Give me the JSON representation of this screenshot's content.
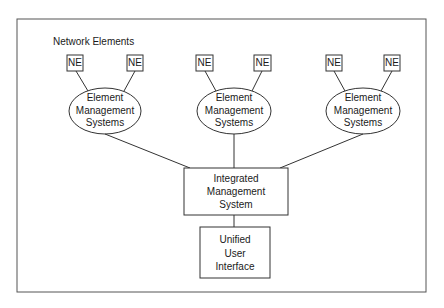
{
  "diagram": {
    "section_label": "Network Elements",
    "ne_label": "NE",
    "ems_groups": [
      {
        "line1": "Element",
        "line2": "Management",
        "line3": "Systems",
        "ne_left": "NE",
        "ne_right": "NE"
      },
      {
        "line1": "Element",
        "line2": "Management",
        "line3": "Systems",
        "ne_left": "NE",
        "ne_right": "NE"
      },
      {
        "line1": "Element",
        "line2": "Management",
        "line3": "Systems",
        "ne_left": "NE",
        "ne_right": "NE"
      }
    ],
    "ims": {
      "line1": "Integrated",
      "line2": "Management",
      "line3": "System"
    },
    "uui": {
      "line1": "Unified",
      "line2": "User",
      "line3": "Interface"
    },
    "colors": {
      "stroke": "#333333",
      "background": "#ffffff"
    }
  }
}
